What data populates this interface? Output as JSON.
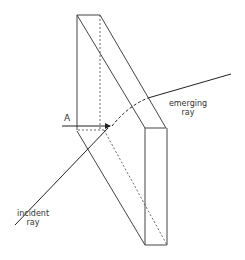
{
  "diagram": {
    "labels": {
      "a": "A",
      "emerging_line1": "emerging",
      "emerging_line2": "ray",
      "incident_line1": "incident",
      "incident_line2": "ray"
    },
    "colors": {
      "stroke": "#333333",
      "background": "#ffffff"
    }
  }
}
